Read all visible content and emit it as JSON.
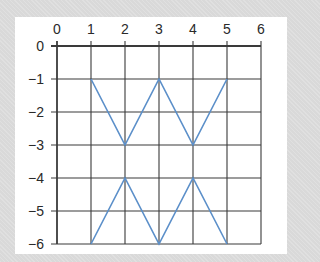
{
  "chart_data": {
    "type": "line",
    "title": "",
    "xlabel": "",
    "ylabel": "",
    "xlim": [
      0,
      6
    ],
    "ylim": [
      -6,
      0
    ],
    "grid": true,
    "x_ticks": [
      "0",
      "1",
      "2",
      "3",
      "4",
      "5",
      "6"
    ],
    "y_ticks": [
      "0",
      "−1",
      "−2",
      "−3",
      "−4",
      "−5",
      "−6"
    ],
    "series": [
      {
        "name": "upper zigzag",
        "x": [
          1,
          2,
          3,
          4,
          5
        ],
        "y": [
          -1,
          -3,
          -1,
          -3,
          -1
        ]
      },
      {
        "name": "lower zigzag",
        "x": [
          1,
          2,
          3,
          4,
          5
        ],
        "y": [
          -6,
          -4,
          -6,
          -4,
          -6
        ]
      }
    ],
    "colors": {
      "line": "#5b8fc9",
      "grid": "#3a3a3a",
      "background": "#d9d9d9",
      "panel": "#ffffff"
    }
  }
}
